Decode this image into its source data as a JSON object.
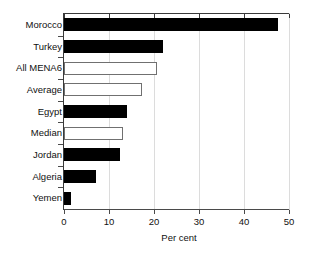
{
  "chart_data": {
    "type": "bar",
    "orientation": "horizontal",
    "title": "",
    "subtitle": "",
    "xlabel": "Per cent",
    "ylabel": "",
    "xlim": [
      0,
      50
    ],
    "xticks": [
      0,
      10,
      20,
      30,
      40,
      50
    ],
    "xtick_labels": [
      "0",
      "10",
      "20",
      "30",
      "40",
      "50"
    ],
    "grid": "vertical",
    "legend": "none",
    "categories": [
      "Morocco",
      "Turkey",
      "All MENA6",
      "Average",
      "Egypt",
      "Median",
      "Jordan",
      "Algeria",
      "Yemen"
    ],
    "values": [
      47.6,
      22.0,
      20.7,
      17.4,
      14.0,
      13.1,
      12.4,
      7.0,
      1.5
    ],
    "bar_styles": [
      "filled",
      "filled",
      "hollow",
      "hollow",
      "filled",
      "hollow",
      "filled",
      "filled",
      "filled"
    ],
    "series": [
      {
        "name": "Per cent",
        "values": [
          47.6,
          22.0,
          20.7,
          17.4,
          14.0,
          13.1,
          12.4,
          7.0,
          1.5
        ]
      }
    ],
    "colors": {
      "filled_bar": "#000000",
      "hollow_bar_fill": "#ffffff",
      "hollow_bar_edge": "#707070",
      "gridline": "#dcdcdc",
      "axis": "#3a3a3a",
      "text": "#111111",
      "background": "#ffffff"
    }
  }
}
